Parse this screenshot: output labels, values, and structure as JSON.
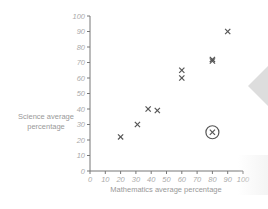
{
  "chart_data": {
    "type": "scatter",
    "title": "",
    "xlabel": "Mathematics average percentage",
    "ylabel": "Science average percentage",
    "ylabel_lines": [
      "Science average",
      "percentage"
    ],
    "xlim": [
      0,
      100
    ],
    "ylim": [
      0,
      100
    ],
    "x_ticks": [
      0,
      10,
      20,
      30,
      40,
      50,
      60,
      70,
      80,
      90,
      100
    ],
    "y_ticks": [
      0,
      10,
      20,
      30,
      40,
      50,
      60,
      70,
      80,
      90,
      100
    ],
    "grid": false,
    "marker": "x",
    "points": [
      {
        "x": 20,
        "y": 22
      },
      {
        "x": 31,
        "y": 30
      },
      {
        "x": 38,
        "y": 40
      },
      {
        "x": 44,
        "y": 39
      },
      {
        "x": 60,
        "y": 65
      },
      {
        "x": 60,
        "y": 60
      },
      {
        "x": 80,
        "y": 72
      },
      {
        "x": 80,
        "y": 71
      },
      {
        "x": 90,
        "y": 90
      }
    ],
    "outlier": {
      "x": 80,
      "y": 25,
      "annotation": "circled"
    },
    "colors": {
      "axis": "#777777",
      "tick_text": "#aaaaaa",
      "label_text": "#999999",
      "marker": "#555555",
      "side_tab": "#dcdcdc"
    }
  }
}
